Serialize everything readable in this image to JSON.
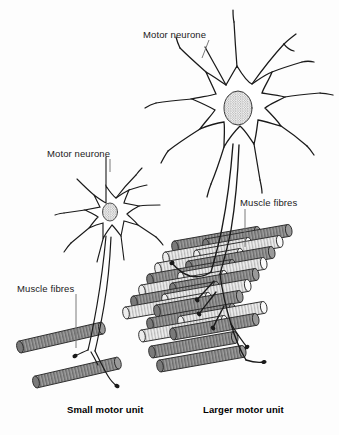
{
  "figure": {
    "background_color": "#fdfdfd",
    "width": 339,
    "height": 435
  },
  "labels": {
    "motor_neurone_large": "Motor neurone",
    "motor_neurone_small": "Motor neurone",
    "muscle_fibres_large": "Muscle fibres",
    "muscle_fibres_small": "Muscle fibres"
  },
  "captions": {
    "small_unit": "Small motor unit",
    "large_unit": "Larger motor unit"
  },
  "colors": {
    "ink": "#1a1a1a",
    "fibre_dark": "#8e8e8e",
    "fibre_light": "#f2f2f2",
    "fibre_outline": "#2b2b2b",
    "leader_line": "#7a7a7a",
    "soma_fill": "#ffffff",
    "nucleus_fill": "#e8e8e8"
  },
  "diagram": {
    "small_motor_unit": {
      "neurone_count": 1,
      "muscle_fibre_count": 2,
      "fibre_shading": [
        "dark",
        "dark"
      ],
      "axon_terminal_count": 2
    },
    "large_motor_unit": {
      "neurone_count": 1,
      "muscle_fibre_rows": 9,
      "muscle_fibre_count": 22,
      "fibre_shading_pattern": "alternating dark and light",
      "axon_terminal_count": 6
    }
  }
}
